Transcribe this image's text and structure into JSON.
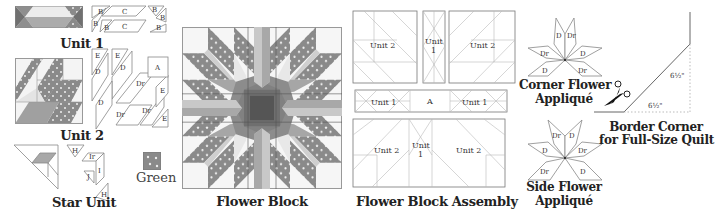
{
  "colors": {
    "green_print": "#8a8a8a",
    "green_dark": "#6e6e6e",
    "medium": "#a8a8a8",
    "light": "#d6d6d6",
    "white": "#f4f4f4",
    "outline": "#9a9a9a",
    "caption": "#222222"
  },
  "unit1": {
    "caption": "Unit 1",
    "pieces": [
      "B",
      "B",
      "C",
      "B",
      "B",
      "B",
      "C",
      "B"
    ]
  },
  "unit2": {
    "caption": "Unit 2",
    "pieces": [
      "E",
      "E",
      "D",
      "D",
      "D",
      "Dr",
      "Dr",
      "Dr",
      "E",
      "E",
      "A"
    ]
  },
  "star_unit": {
    "caption": "Star Unit",
    "pieces": [
      "H",
      "Ir",
      "I",
      "J",
      "H"
    ]
  },
  "swatch": {
    "label": "Green"
  },
  "flower_block": {
    "caption": "Flower Block"
  },
  "assembly": {
    "caption": "Flower Block Assembly",
    "top_left": "Unit 2",
    "top_mid_1": "Unit",
    "top_mid_2": "1",
    "top_right": "Unit 2",
    "mid_left": "Unit 1",
    "mid_center": "A",
    "mid_right": "Unit 1",
    "bot_left": "Unit 2",
    "bot_mid_1": "Unit",
    "bot_mid_2": "1",
    "bot_right": "Unit 2"
  },
  "corner_flower": {
    "caption_line1": "Corner Flower",
    "caption_line2": "Appliqué",
    "pieces": [
      "D",
      "Dr",
      "Dr",
      "D",
      "D",
      "Dr"
    ]
  },
  "side_flower": {
    "caption_line1": "Side Flower",
    "caption_line2": "Appliqué",
    "pieces": [
      "Dr",
      "D",
      "D",
      "Dr",
      "Dr",
      "D"
    ]
  },
  "border_corner": {
    "caption_line1": "Border Corner",
    "caption_line2": "for Full-Size Quilt",
    "dim_vertical": "6½\"",
    "dim_horizontal": "6½\""
  }
}
